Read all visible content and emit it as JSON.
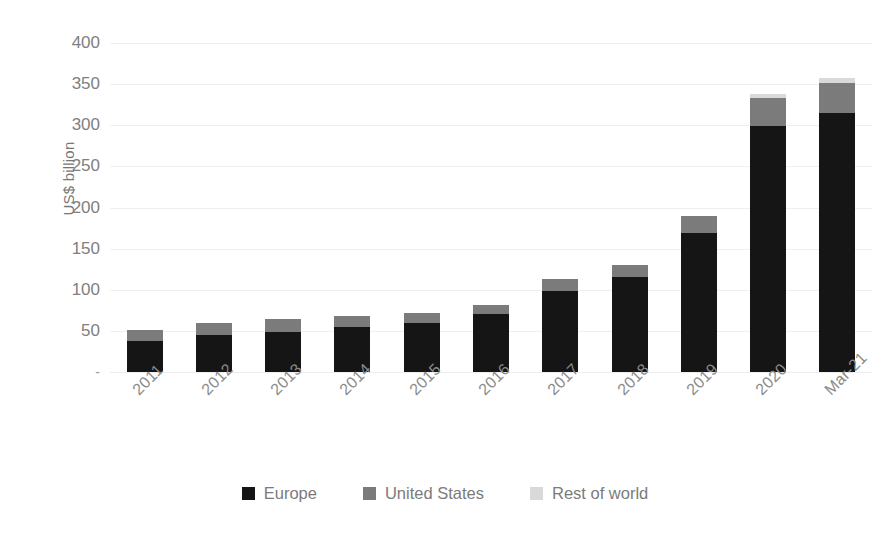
{
  "chart_data": {
    "type": "bar",
    "subtype": "stacked-vertical",
    "title": "",
    "subtitle": "",
    "xlabel": "",
    "ylabel": "US$ billion",
    "categories": [
      "2011",
      "2012",
      "2013",
      "2014",
      "2015",
      "2016",
      "2017",
      "2018",
      "2019",
      "2020",
      "Mar-21"
    ],
    "series": [
      {
        "name": "Europe",
        "color": "#151515",
        "values": [
          38,
          45,
          49,
          55,
          59,
          70,
          99,
          115,
          169,
          299,
          315
        ]
      },
      {
        "name": "United States",
        "color": "#7b7b7b",
        "values": [
          13,
          15,
          15,
          13,
          13,
          12,
          14,
          15,
          21,
          34,
          36
        ]
      },
      {
        "name": "Rest of world",
        "color": "#d9d9d9",
        "values": [
          0,
          0,
          0,
          0,
          0,
          0,
          0,
          0,
          0,
          5,
          6
        ]
      }
    ],
    "totals": [
      51,
      60,
      64,
      68,
      72,
      82,
      113,
      130,
      190,
      338,
      357
    ],
    "ylim": [
      0,
      400
    ],
    "y_ticks": [
      0,
      50,
      100,
      150,
      200,
      250,
      300,
      350,
      400
    ],
    "y_tick_labels": [
      "-",
      "50",
      "100",
      "150",
      "200",
      "250",
      "300",
      "350",
      "400"
    ],
    "grid": true,
    "grid_axis": "y",
    "legend_position": "bottom",
    "x_tick_rotation": -45
  },
  "colors": {
    "europe": "#151515",
    "united_states": "#7b7b7b",
    "rest_of_world": "#d9d9d9",
    "gridline": "#efefef",
    "text": "#808080",
    "background": "#ffffff"
  },
  "legend": {
    "items": [
      {
        "label": "Europe",
        "color": "#151515",
        "swatch_name": "legend-swatch-europe"
      },
      {
        "label": "United States",
        "color": "#7b7b7b",
        "swatch_name": "legend-swatch-united-states"
      },
      {
        "label": "Rest of world",
        "color": "#d9d9d9",
        "swatch_name": "legend-swatch-rest-of-world"
      }
    ]
  }
}
